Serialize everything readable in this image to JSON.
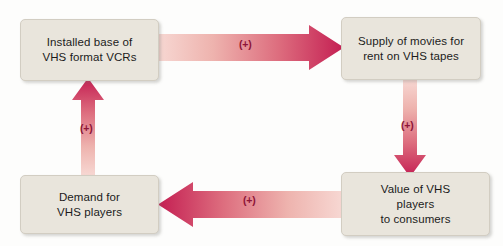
{
  "diagram": {
    "background_color": "#fdfdfc",
    "box_fill_color": "#e9e5dc",
    "box_border_color": "#d2cdc2",
    "arrow_light_color": "#f5cdc8",
    "arrow_dark_color": "#c41e52",
    "sign_text_color": "#8e1538",
    "nodes": [
      {
        "id": "installed_base",
        "label": "Installed base of\nVHS format VCRs"
      },
      {
        "id": "supply_movies",
        "label": "Supply of movies for\nrent on VHS tapes"
      },
      {
        "id": "value_players",
        "label": "Value of VHS\nplayers\nto consumers"
      },
      {
        "id": "demand_players",
        "label": "Demand for\nVHS players"
      }
    ],
    "arrows": [
      {
        "id": "top",
        "from": "installed_base",
        "to": "supply_movies",
        "direction": "right",
        "sign": "(+)"
      },
      {
        "id": "right",
        "from": "supply_movies",
        "to": "value_players",
        "direction": "down",
        "sign": "(+)"
      },
      {
        "id": "bottom",
        "from": "value_players",
        "to": "demand_players",
        "direction": "left",
        "sign": "(+)"
      },
      {
        "id": "left",
        "from": "demand_players",
        "to": "installed_base",
        "direction": "up",
        "sign": "(+)"
      }
    ]
  }
}
